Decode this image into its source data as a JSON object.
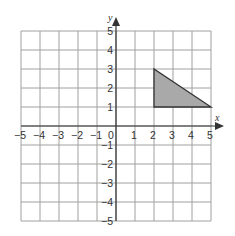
{
  "chart_data": {
    "type": "scatter",
    "title": "",
    "xlabel": "x",
    "ylabel": "y",
    "xlim": [
      -5,
      5
    ],
    "ylim": [
      -5,
      5
    ],
    "grid": true,
    "x_ticks": [
      "−5",
      "−4",
      "−3",
      "−2",
      "−1",
      "0",
      "1",
      "2",
      "3",
      "4",
      "5"
    ],
    "y_ticks": [
      "5",
      "4",
      "3",
      "2",
      "1",
      "−1",
      "−2",
      "−3",
      "−4",
      "−5"
    ],
    "shapes": [
      {
        "name": "triangle",
        "vertices": [
          [
            2,
            3
          ],
          [
            2,
            1
          ],
          [
            5,
            1
          ]
        ],
        "fill": "#a9a9a9",
        "stroke": "#333333"
      }
    ]
  },
  "colors": {
    "grid": "#a0a0a0",
    "axis": "#333333",
    "shape_fill": "#a9a9a9",
    "shape_stroke": "#333333"
  }
}
